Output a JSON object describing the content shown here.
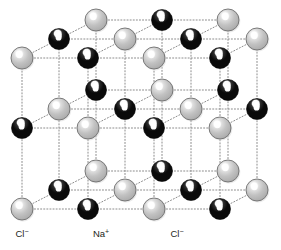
{
  "figure": {
    "name": "sodium-chloride-crystal-lattice",
    "title": "",
    "background_color": "#ffffff",
    "bond_line": {
      "color": "#8c8c8c",
      "style": "dotted",
      "width": 1
    },
    "ion_types": {
      "chloride": {
        "label": "Cl⁻",
        "color": "#bcbcbc",
        "edge_color": "#6e6e6e",
        "highlight_color": "#ffffff",
        "radius": 11
      },
      "sodium": {
        "label": "Na⁺",
        "color": "#141414",
        "edge_color": "#000000",
        "highlight_color": "#ffffff",
        "radius": 10.5
      }
    },
    "labels": [
      {
        "name": "label-chloride-left",
        "text": "Cl",
        "charge": "−",
        "x": 22,
        "y": 237
      },
      {
        "name": "label-sodium-center",
        "text": "Na",
        "charge": "+",
        "x": 101,
        "y": 237
      },
      {
        "name": "label-chloride-right",
        "text": "Cl",
        "charge": "−",
        "x": 177,
        "y": 237
      }
    ],
    "grid": {
      "columns": 4,
      "rows": 3,
      "depth_layers": 3,
      "origin_x": 22,
      "origin_y": 209,
      "step_x": 66,
      "step_y": -68,
      "depth_dx": 37,
      "depth_dy": -29
    },
    "atoms": [
      {
        "id": "a-0-0-0",
        "type": "chloride",
        "x": 22,
        "y": 209,
        "layer": 0
      },
      {
        "id": "a-1-0-0",
        "type": "sodium",
        "x": 88,
        "y": 209,
        "layer": 0
      },
      {
        "id": "a-2-0-0",
        "type": "chloride",
        "x": 154,
        "y": 209,
        "layer": 0
      },
      {
        "id": "a-3-0-0",
        "type": "sodium",
        "x": 220,
        "y": 209,
        "layer": 0
      },
      {
        "id": "a-0-0-1",
        "type": "sodium",
        "x": 59,
        "y": 190,
        "layer": 1
      },
      {
        "id": "a-1-0-1",
        "type": "chloride",
        "x": 125,
        "y": 190,
        "layer": 1
      },
      {
        "id": "a-2-0-1",
        "type": "sodium",
        "x": 191,
        "y": 190,
        "layer": 1
      },
      {
        "id": "a-3-0-1",
        "type": "chloride",
        "x": 257,
        "y": 190,
        "layer": 1
      },
      {
        "id": "a-0-0-2",
        "type": "chloride",
        "x": 96,
        "y": 171,
        "layer": 2
      },
      {
        "id": "a-1-0-2",
        "type": "sodium",
        "x": 162,
        "y": 171,
        "layer": 2
      },
      {
        "id": "a-2-0-2",
        "type": "chloride",
        "x": 228,
        "y": 171,
        "layer": 2
      },
      {
        "id": "a-0-1-0",
        "type": "sodium",
        "x": 22,
        "y": 128,
        "layer": 0
      },
      {
        "id": "a-1-1-0",
        "type": "chloride",
        "x": 88,
        "y": 128,
        "layer": 0
      },
      {
        "id": "a-2-1-0",
        "type": "sodium",
        "x": 154,
        "y": 128,
        "layer": 0
      },
      {
        "id": "a-3-1-0",
        "type": "chloride",
        "x": 220,
        "y": 128,
        "layer": 0
      },
      {
        "id": "a-0-1-1",
        "type": "chloride",
        "x": 59,
        "y": 109,
        "layer": 1
      },
      {
        "id": "a-1-1-1",
        "type": "sodium",
        "x": 125,
        "y": 109,
        "layer": 1
      },
      {
        "id": "a-2-1-1",
        "type": "chloride",
        "x": 191,
        "y": 109,
        "layer": 1
      },
      {
        "id": "a-3-1-1",
        "type": "sodium",
        "x": 257,
        "y": 109,
        "layer": 1
      },
      {
        "id": "a-0-1-2",
        "type": "sodium",
        "x": 96,
        "y": 90,
        "layer": 2
      },
      {
        "id": "a-1-1-2",
        "type": "chloride",
        "x": 162,
        "y": 90,
        "layer": 2
      },
      {
        "id": "a-2-1-2",
        "type": "sodium",
        "x": 228,
        "y": 90,
        "layer": 2
      },
      {
        "id": "a-0-2-0",
        "type": "chloride",
        "x": 22,
        "y": 58,
        "layer": 0
      },
      {
        "id": "a-1-2-0",
        "type": "sodium",
        "x": 88,
        "y": 58,
        "layer": 0
      },
      {
        "id": "a-2-2-0",
        "type": "chloride",
        "x": 154,
        "y": 58,
        "layer": 0
      },
      {
        "id": "a-3-2-0",
        "type": "sodium",
        "x": 220,
        "y": 58,
        "layer": 0
      },
      {
        "id": "a-0-2-1",
        "type": "sodium",
        "x": 59,
        "y": 39,
        "layer": 1
      },
      {
        "id": "a-1-2-1",
        "type": "chloride",
        "x": 125,
        "y": 39,
        "layer": 1
      },
      {
        "id": "a-2-2-1",
        "type": "sodium",
        "x": 191,
        "y": 39,
        "layer": 1
      },
      {
        "id": "a-3-2-1",
        "type": "chloride",
        "x": 257,
        "y": 39,
        "layer": 1
      },
      {
        "id": "a-0-2-2",
        "type": "chloride",
        "x": 96,
        "y": 20,
        "layer": 2
      },
      {
        "id": "a-1-2-2",
        "type": "sodium",
        "x": 162,
        "y": 20,
        "layer": 2
      },
      {
        "id": "a-2-2-2",
        "type": "chloride",
        "x": 228,
        "y": 20,
        "layer": 2
      }
    ]
  }
}
